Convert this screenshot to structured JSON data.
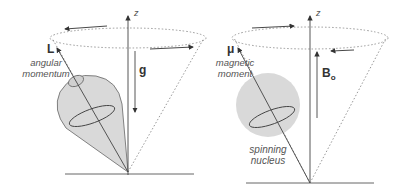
{
  "left_panel": {
    "vector_label": "L",
    "vector_desc_1": "angular",
    "vector_desc_2": "momentum",
    "field_label": "g",
    "axis_label": "z"
  },
  "right_panel": {
    "vector_label": "μ",
    "vector_desc_1": "magnetic",
    "vector_desc_2": "moment",
    "field_label": "B",
    "field_sub": "o",
    "axis_label": "z",
    "body_label_1": "spinning",
    "body_label_2": "nucleus"
  },
  "colors": {
    "fill": "#d9d9d9",
    "line": "#444444",
    "dotted": "#999999"
  }
}
